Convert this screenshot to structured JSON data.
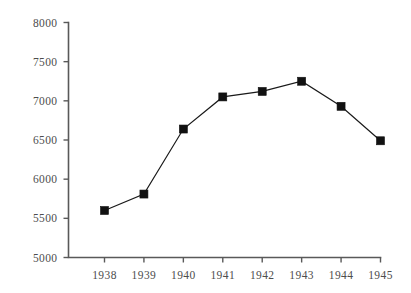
{
  "chart_data": {
    "type": "line",
    "title": "",
    "subtitle": "",
    "xlabel": "",
    "ylabel": "",
    "categories": [
      "1938",
      "1939",
      "1940",
      "1941",
      "1942",
      "1943",
      "1944",
      "1945"
    ],
    "values": [
      5600,
      5810,
      6640,
      7050,
      7120,
      7250,
      6930,
      6490
    ],
    "series": [
      {
        "name": "",
        "values": [
          5600,
          5810,
          6640,
          7050,
          7120,
          7250,
          6930,
          6490
        ]
      }
    ],
    "ylim": [
      5000,
      8000
    ],
    "ytick_labels": [
      "5000",
      "5500",
      "6000",
      "6500",
      "7000",
      "7500",
      "8000"
    ],
    "ytick_values": [
      5000,
      5500,
      6000,
      6500,
      7000,
      7500,
      8000
    ],
    "xtick_labels": [
      "1938",
      "1939",
      "1940",
      "1941",
      "1942",
      "1943",
      "1944",
      "1945"
    ],
    "grid": false,
    "legend": false,
    "legend_position": "none",
    "marker": "square",
    "annotations": [],
    "colors": {
      "line": "#1a1a1a",
      "marker": "#111111",
      "axis": "#595959",
      "tick_label": "#4d4d4d",
      "background": "#ffffff"
    }
  }
}
